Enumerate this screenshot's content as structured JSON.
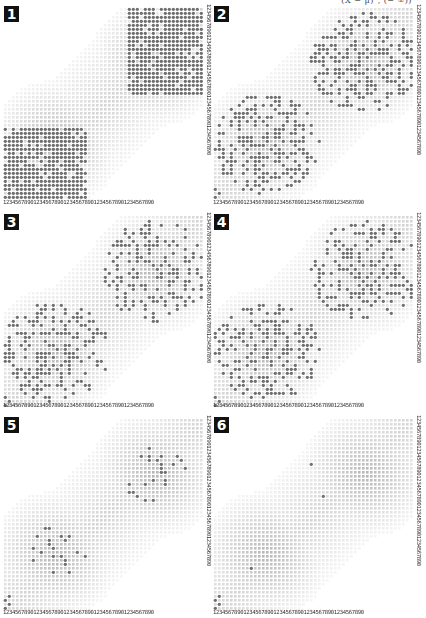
{
  "figure": {
    "top_caption": "(X − μ)ᵀ, (− ∞))",
    "axis_digits": "12345678901234567890123456789012345678901234567890",
    "colors": {
      "background": "#ffffff",
      "grid_dot": "#d4d4d4",
      "density_dot": "#bdbdbd",
      "data_dot": "#6f6f6f",
      "badge_bg": "#111111",
      "badge_fg": "#ffffff",
      "axis_text": "#333333"
    },
    "grid": {
      "cols": 50,
      "rows": 48,
      "pitch": 4,
      "dot_size": 2.6
    },
    "panels": [
      {
        "label": "1",
        "x": 0,
        "y": 0,
        "w": 210,
        "h": 208,
        "cluster_fill": 0.85,
        "shape": "rect",
        "corner_dots": 0
      },
      {
        "label": "2",
        "x": 210,
        "y": 0,
        "w": 216,
        "h": 208,
        "cluster_fill": 0.38,
        "shape": "blob",
        "corner_dots": 3
      },
      {
        "label": "3",
        "x": 0,
        "y": 208,
        "w": 210,
        "h": 203,
        "cluster_fill": 0.34,
        "shape": "blob",
        "corner_dots": 3
      },
      {
        "label": "4",
        "x": 210,
        "y": 208,
        "w": 216,
        "h": 203,
        "cluster_fill": 0.3,
        "shape": "blob",
        "corner_dots": 3
      },
      {
        "label": "5",
        "x": 0,
        "y": 411,
        "w": 210,
        "h": 207,
        "cluster_fill": 0.09,
        "shape": "circle",
        "corner_dots": 4
      },
      {
        "label": "6",
        "x": 210,
        "y": 411,
        "w": 216,
        "h": 207,
        "cluster_fill": 0.0,
        "shape": "circle",
        "corner_dots": 4,
        "explicit_dots": [
          [
            24,
            11
          ],
          [
            27,
            19
          ],
          [
            9,
            37
          ]
        ]
      }
    ],
    "clusters": [
      {
        "name": "lower-left",
        "cx": 0.25,
        "cy": 0.7,
        "r": 0.22
      },
      {
        "name": "upper-right",
        "cx": 0.75,
        "cy": 0.28,
        "r": 0.22
      }
    ]
  }
}
